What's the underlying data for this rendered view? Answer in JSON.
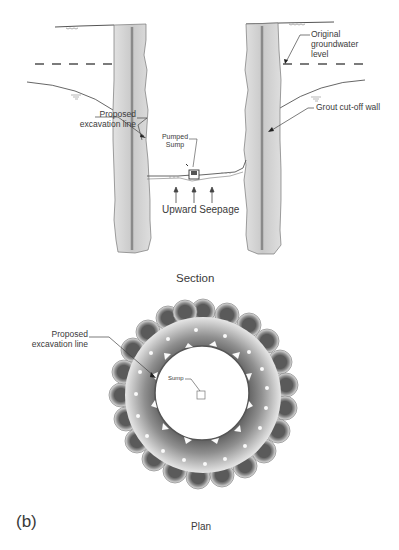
{
  "section": {
    "title": "Section",
    "labels": {
      "proposed_excavation_line": [
        "Proposed",
        "excavation line"
      ],
      "pumped_sump": [
        "Pumped",
        "Sump"
      ],
      "original_groundwater_level": [
        "Original",
        "groundwater",
        "level"
      ],
      "grout_cutoff_wall": "Grout cut-off wall",
      "upward_seepage": "Upward Seepage"
    }
  },
  "plan": {
    "title": "Plan",
    "labels": {
      "proposed_excavation_line": [
        "Proposed",
        "excavation line"
      ],
      "sump": "Sump"
    }
  },
  "figure_label": "(b)",
  "colors": {
    "wall_fill": "#d6d6d6",
    "wall_core": "#8c8c8c",
    "outline": "#555555",
    "grout_dark": "#6e6e6e",
    "grout_light": "#e8e8e8"
  }
}
